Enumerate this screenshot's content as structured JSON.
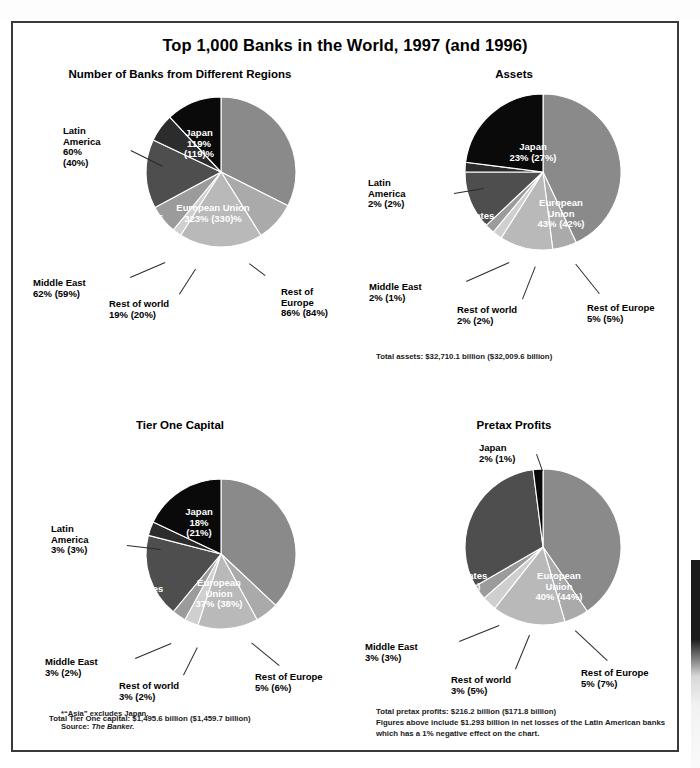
{
  "title": "Top 1,000 Banks in the World, 1997 (and 1996)",
  "footnotes": {
    "asia": "*“Asia” excludes Japan.",
    "source_label": "Source: ",
    "source_name": "The Banker."
  },
  "colors": {
    "european_union": "#8a8a8a",
    "rest_of_europe": "#aaaaaa",
    "asia": "#b9b9b9",
    "rest_of_world": "#cfcfcf",
    "middle_east": "#9b9b9b",
    "united_states": "#4e4e4e",
    "latin_america": "#2c2c2c",
    "japan": "#0a0a0a",
    "frame": "#3a3a3a",
    "text": "#000000",
    "inside_label": "#ffffff"
  },
  "chart_data": [
    {
      "type": "pie",
      "id": "number-of-banks",
      "title": "Number of Banks from Different Regions",
      "unit": "number of banks",
      "total_note": "",
      "categories": [
        "European Union",
        "Rest of Europe",
        "Asia*",
        "Rest of world",
        "Middle East",
        "United States",
        "Latin America",
        "Japan"
      ],
      "values": [
        323,
        86,
        179,
        19,
        62,
        148,
        60,
        119
      ],
      "values_prior": [
        330,
        84,
        172,
        20,
        59,
        156,
        40,
        119
      ],
      "labels": [
        {
          "name": "European Union",
          "value": "323% (330)%",
          "placement": "inside"
        },
        {
          "name": "Rest of\nEurope",
          "value": "86% (84%)",
          "placement": "outside"
        },
        {
          "name": "Asia*",
          "value": "179% (172%)",
          "placement": "inside"
        },
        {
          "name": "Rest of world",
          "value": "19% (20%)",
          "placement": "outside"
        },
        {
          "name": "Middle East",
          "value": "62% (59%)",
          "placement": "outside"
        },
        {
          "name": "United States",
          "value": "148% (156%)",
          "placement": "inside"
        },
        {
          "name": "Latin\nAmerica",
          "value": "60%\n(40%)",
          "placement": "outside"
        },
        {
          "name": "Japan",
          "value": "119%\n(119)%",
          "placement": "inside"
        }
      ]
    },
    {
      "type": "pie",
      "id": "assets",
      "title": "Assets",
      "unit": "percent of total assets",
      "total_note": "Total assets: $32,710.1 billion ($32,009.6 billion)",
      "categories": [
        "European Union",
        "Rest of Europe",
        "Asia*",
        "Rest of world",
        "Middle East",
        "United States",
        "Latin America",
        "Japan"
      ],
      "values": [
        43,
        5,
        11,
        2,
        2,
        12,
        2,
        23
      ],
      "values_prior": [
        42,
        5,
        10,
        2,
        1,
        11,
        2,
        27
      ],
      "labels": [
        {
          "name": "European\nUnion",
          "value": "43% (42%)",
          "placement": "inside"
        },
        {
          "name": "Rest of Europe",
          "value": "5% (5%)",
          "placement": "outside"
        },
        {
          "name": "Asia*",
          "value": "11%\n(10%)",
          "placement": "inside"
        },
        {
          "name": "Rest of world",
          "value": "2% (2%)",
          "placement": "outside"
        },
        {
          "name": "Middle East",
          "value": "2% (1%)",
          "placement": "outside"
        },
        {
          "name": "United States",
          "value": "12% (11%)",
          "placement": "inside"
        },
        {
          "name": "Latin\nAmerica",
          "value": "2% (2%)",
          "placement": "outside"
        },
        {
          "name": "Japan",
          "value": "23% (27%)",
          "placement": "inside"
        }
      ]
    },
    {
      "type": "pie",
      "id": "tier-one-capital",
      "title": "Tier One Capital",
      "unit": "percent of total Tier One capital",
      "total_note": "Total Tier One capital: $1,495.6 billion ($1,459.7 billion)",
      "categories": [
        "European Union",
        "Rest of Europe",
        "Asia*",
        "Rest of world",
        "Middle East",
        "United States",
        "Latin America",
        "Japan"
      ],
      "values": [
        37,
        5,
        13,
        3,
        3,
        18,
        3,
        18
      ],
      "values_prior": [
        38,
        6,
        12,
        2,
        2,
        16,
        3,
        21
      ],
      "labels": [
        {
          "name": "European\nUnion",
          "value": "37% (38%)",
          "placement": "inside"
        },
        {
          "name": "Rest of Europe",
          "value": "5% (6%)",
          "placement": "outside"
        },
        {
          "name": "Asia*",
          "value": "13%\n(12%)",
          "placement": "inside"
        },
        {
          "name": "Rest of world",
          "value": "3% (2%)",
          "placement": "outside"
        },
        {
          "name": "Middle East",
          "value": "3% (2%)",
          "placement": "outside"
        },
        {
          "name": "United States",
          "value": "18% (16%)",
          "placement": "inside"
        },
        {
          "name": "Latin\nAmerica",
          "value": "3% (3%)",
          "placement": "outside"
        },
        {
          "name": "Japan",
          "value": "18%\n(21%)",
          "placement": "inside"
        }
      ]
    },
    {
      "type": "pie",
      "id": "pretax-profits",
      "title": "Pretax Profits",
      "unit": "percent of total pretax profits",
      "total_note": "Total pretax profits: $216.2 billion ($171.8 billion)",
      "extra_note": "Figures above include $1.293 billion in net losses of the Latin American banks which has a 1% negative effect on the chart.",
      "categories": [
        "European Union",
        "Rest of Europe",
        "Asia*",
        "Rest of world",
        "Middle East",
        "United States",
        "Japan"
      ],
      "values": [
        40,
        5,
        15,
        3,
        3,
        31,
        2
      ],
      "values_prior": [
        44,
        7,
        16,
        5,
        3,
        34,
        1
      ],
      "labels": [
        {
          "name": "European\nUnion",
          "value": "40% (44%)",
          "placement": "inside"
        },
        {
          "name": "Rest of Europe",
          "value": "5% (7%)",
          "placement": "outside"
        },
        {
          "name": "Asia*",
          "value": "15%\n(16%)",
          "placement": "inside"
        },
        {
          "name": "Rest of world",
          "value": "3% (5%)",
          "placement": "outside"
        },
        {
          "name": "Middle East",
          "value": "3% (3%)",
          "placement": "outside"
        },
        {
          "name": "United States",
          "value": "31% (34%)",
          "placement": "inside"
        },
        {
          "name": "Japan",
          "value": "2% (1%)",
          "placement": "outside"
        }
      ]
    }
  ]
}
